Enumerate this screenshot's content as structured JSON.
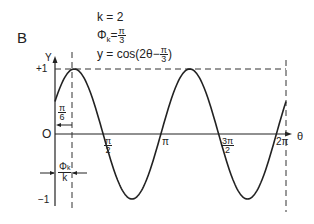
{
  "panel": {
    "label": "B"
  },
  "equations": {
    "k": "k = 2",
    "phi_sym": "Φ",
    "phi_sub": "k",
    "phi_eq": "=",
    "phi_num": "π",
    "phi_den": "3",
    "y_prefix": "y = cos(2θ−",
    "y_num": "π",
    "y_den": "3",
    "y_suffix": ")"
  },
  "axes": {
    "y_label": "Y",
    "x_label": "θ",
    "origin": "O",
    "y_plus": "+1",
    "y_minus": "−1"
  },
  "ticks": {
    "pi6_num": "π",
    "pi6_den": "6",
    "pi2_num": "π",
    "pi2_den": "2",
    "pi": "π",
    "three_pi2_num": "3π",
    "three_pi2_den": "2",
    "two_pi": "2π"
  },
  "annotation": {
    "shift_num_sym": "Φ",
    "shift_num_sub": "k",
    "shift_den": "k"
  },
  "chart_data": {
    "type": "line",
    "parameters": {
      "k": 2,
      "phi_k": "π/3"
    },
    "xlabel": "θ",
    "ylabel": "Y",
    "xlim": [
      0,
      6.2832
    ],
    "ylim": [
      -1,
      1
    ],
    "x_ticks": [
      "π/2",
      "π",
      "3π/2",
      "2π"
    ],
    "y_ticks": [
      "+1",
      "O",
      "−1"
    ],
    "annotations": [
      "π/6 (peak offset)",
      "Φk/k (phase shift)"
    ],
    "series": [
      {
        "name": "y = cos(2θ − π/3)",
        "x": [
          0,
          0.5236,
          1.309,
          2.0944,
          2.8798,
          3.6652,
          4.4506,
          5.236,
          6.0214,
          6.2832
        ],
        "values": [
          0.5,
          1,
          0,
          -1,
          0,
          1,
          0,
          -1,
          0,
          0.5
        ]
      }
    ],
    "grid": false
  }
}
